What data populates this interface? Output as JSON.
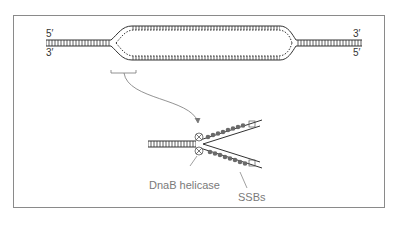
{
  "diagram": {
    "top": {
      "left_labels": {
        "top": "5′",
        "bottom": "3′"
      },
      "right_labels": {
        "top": "3′",
        "bottom": "5′"
      }
    },
    "callouts": {
      "helicase": "DnaB helicase",
      "ssb": "SSBs"
    },
    "colors": {
      "line": "#333333",
      "frame": "#8a8a8a",
      "caption": "#7a7a7a",
      "protein": "#666666"
    }
  }
}
